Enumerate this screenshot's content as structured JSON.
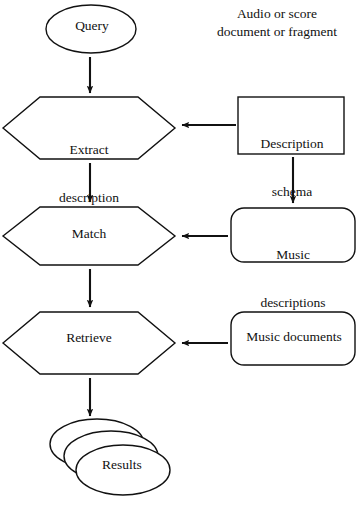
{
  "diagram": {
    "type": "flowchart",
    "background_color": "#ffffff",
    "stroke_color": "#111111",
    "caption": {
      "line1": "Audio or score",
      "line2": "document or fragment",
      "full": "Audio or score document or fragment"
    },
    "nodes": [
      {
        "id": "query",
        "label": "Query",
        "shape": "ellipse",
        "column": "left"
      },
      {
        "id": "extract-description",
        "label_line1": "Extract",
        "label_line2": "description",
        "label": "Extract description",
        "shape": "hexagon",
        "column": "left"
      },
      {
        "id": "match",
        "label": "Match",
        "shape": "hexagon",
        "column": "left"
      },
      {
        "id": "retrieve",
        "label": "Retrieve",
        "shape": "hexagon",
        "column": "left"
      },
      {
        "id": "results",
        "label": "Results",
        "shape": "stacked-ellipses",
        "column": "left",
        "stack_count": 3
      },
      {
        "id": "description-schema",
        "label_line1": "Description",
        "label_line2": "schema",
        "label": "Description schema",
        "shape": "rectangle",
        "column": "right"
      },
      {
        "id": "music-descriptions",
        "label_line1": "Music",
        "label_line2": "descriptions",
        "label": "Music descriptions",
        "shape": "rounded-rectangle",
        "column": "right"
      },
      {
        "id": "music-documents",
        "label": "Music documents",
        "shape": "rounded-rectangle",
        "column": "right"
      }
    ],
    "edges": [
      {
        "id": "query-to-extract",
        "from": "query",
        "to": "extract-description",
        "direction": "down"
      },
      {
        "id": "extract-to-match",
        "from": "extract-description",
        "to": "match",
        "direction": "down"
      },
      {
        "id": "match-to-retrieve",
        "from": "match",
        "to": "retrieve",
        "direction": "down"
      },
      {
        "id": "retrieve-to-results",
        "from": "retrieve",
        "to": "results",
        "direction": "down"
      },
      {
        "id": "schema-to-extract",
        "from": "description-schema",
        "to": "extract-description",
        "direction": "left"
      },
      {
        "id": "schema-to-descriptions",
        "from": "description-schema",
        "to": "music-descriptions",
        "direction": "down"
      },
      {
        "id": "descriptions-to-match",
        "from": "music-descriptions",
        "to": "match",
        "direction": "left"
      },
      {
        "id": "documents-to-retrieve",
        "from": "music-documents",
        "to": "retrieve",
        "direction": "left"
      }
    ]
  }
}
